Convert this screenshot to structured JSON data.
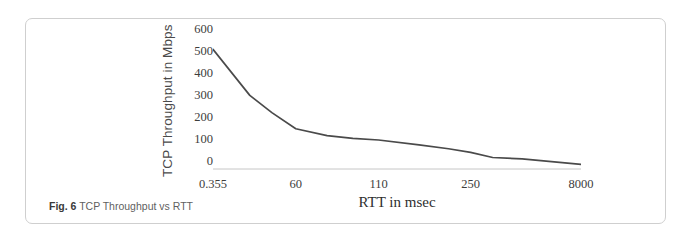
{
  "figure": {
    "caption_label": "Fig. 6",
    "caption_text": "TCP Throughput vs RTT"
  },
  "chart_data": {
    "type": "line",
    "title": "",
    "subtitle": "",
    "xlabel": "RTT in msec",
    "ylabel": "TCP Throughput in Mbps",
    "x_tick_labels": [
      "0.355",
      "60",
      "110",
      "250",
      "8000"
    ],
    "x_tick_positions": [
      0,
      0.225,
      0.45,
      0.7,
      1.0
    ],
    "y_tick_labels": [
      "600",
      "500",
      "400",
      "300",
      "200",
      "100",
      "0"
    ],
    "y_ticks": [
      600,
      500,
      400,
      300,
      200,
      100,
      0
    ],
    "ylim": [
      0,
      600
    ],
    "grid": false,
    "legend": "none",
    "line_color": "#4a4a4a",
    "axis_color": "#bdbdbd",
    "categories": [
      "0.355",
      "20",
      "40",
      "60",
      "85",
      "110",
      "160",
      "250",
      "400",
      "8000"
    ],
    "values": [
      520,
      320,
      245,
      175,
      145,
      133,
      118,
      88,
      50,
      20
    ],
    "points_normalized": [
      [
        0.0,
        520
      ],
      [
        0.1,
        320
      ],
      [
        0.16,
        245
      ],
      [
        0.225,
        175
      ],
      [
        0.31,
        145
      ],
      [
        0.38,
        133
      ],
      [
        0.45,
        126
      ],
      [
        0.56,
        105
      ],
      [
        0.64,
        88
      ],
      [
        0.7,
        72
      ],
      [
        0.76,
        50
      ],
      [
        0.84,
        44
      ],
      [
        1.0,
        20
      ]
    ]
  }
}
